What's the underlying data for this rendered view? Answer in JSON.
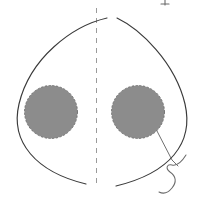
{
  "figure": {
    "width": 207,
    "height": 203,
    "background_color": "#ffffff",
    "orientation": "axial",
    "symmetry": "bilateral about vertical midline"
  },
  "colors": {
    "background": "#ffffff",
    "outline_stroke": "#3a3a3a",
    "midline_stroke": "#9a9a9a",
    "lesion_fill": "#8c8c8c",
    "lesion_stroke": "#6e6e6e",
    "leader_stroke": "#565656",
    "squiggle_stroke": "#6a6a6a"
  },
  "elements": {
    "left_outline_arc": {
      "name": "left outline arc",
      "stroke_color": "#3a3a3a",
      "stroke_width": 1.15,
      "style": "solid",
      "path": "M 107 18 C 72 26, 30 58, 19 104 C 10 142, 36 172, 86 184"
    },
    "right_outline_arc": {
      "name": "right outline arc",
      "stroke_color": "#3a3a3a",
      "stroke_width": 1.15,
      "style": "solid",
      "path": "M 117 18 C 140 29, 175 62, 185 104 C 194 143, 170 173, 116 186"
    },
    "midline_axis": {
      "name": "vertical midline axis",
      "stroke_color": "#9a9a9a",
      "stroke_width": 1,
      "style": "dashed",
      "dash_pattern": "5 5",
      "x": 96.5,
      "y_start": 8,
      "y_end": 186
    },
    "left_lesion": {
      "name": "left shaded circle",
      "cx": 51,
      "cy": 112,
      "r": 26.5,
      "fill": "#8c8c8c",
      "stroke": "#6e6e6e",
      "border_style": "dashed"
    },
    "right_lesion": {
      "name": "right shaded circle",
      "cx": 138,
      "cy": 112,
      "r": 26.5,
      "fill": "#8c8c8c",
      "stroke": "#6e6e6e",
      "border_style": "dashed"
    },
    "leader_line": {
      "name": "leader line from right circle",
      "stroke_color": "#565656",
      "stroke_width": 0.85,
      "path": "M 157 131 L 172 160 L 178 166"
    },
    "squiggle_mark": {
      "name": "hand drawn squiggle annotation",
      "stroke_color": "#6a6a6a",
      "stroke_width": 1.05,
      "path": "M 186 155 C 181 163, 176 166, 172 165 C 167 164, 165 168, 170 172 C 176 176, 177 182, 172 188 C 168 193, 163 194, 159 192"
    },
    "top_tick": {
      "name": "top edge tick mark",
      "stroke_color": "#6a6a6a",
      "stroke_width": 1.1,
      "x": 165,
      "y_start": 0,
      "y_end": 5
    }
  },
  "labels": {
    "figure_caption": "",
    "left_region_label": "",
    "right_region_label": "",
    "midline_label": ""
  }
}
